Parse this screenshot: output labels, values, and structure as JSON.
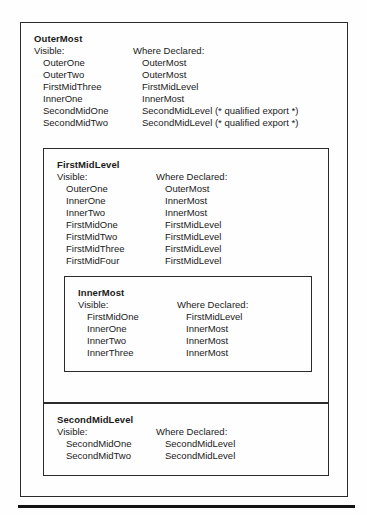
{
  "figure": {
    "kind": "nested-scope-visibility-diagram",
    "column_headers": {
      "visible": "Visible:",
      "where_declared": "Where Declared:"
    },
    "scopes": [
      {
        "id": "outermost",
        "title": "OuterMost",
        "visible": [
          "OuterOne",
          "OuterTwo",
          "FirstMidThree",
          "InnerOne",
          "SecondMidOne",
          "SecondMidTwo"
        ],
        "where_declared": [
          "OuterMost",
          "OuterMost",
          "FirstMidLevel",
          "InnerMost",
          "SecondMidLevel (* qualified export *)",
          "SecondMidLevel (* qualified export *)"
        ]
      },
      {
        "id": "firstmidlevel",
        "title": "FirstMidLevel",
        "visible": [
          "OuterOne",
          "InnerOne",
          "InnerTwo",
          "FirstMidOne",
          "FirstMidTwo",
          "FirstMidThree",
          "FirstMidFour"
        ],
        "where_declared": [
          "OuterMost",
          "InnerMost",
          "InnerMost",
          "FirstMidLevel",
          "FirstMidLevel",
          "FirstMidLevel",
          "FirstMidLevel"
        ]
      },
      {
        "id": "innermost",
        "title": "InnerMost",
        "visible": [
          "FirstMidOne",
          "InnerOne",
          "InnerTwo",
          "InnerThree"
        ],
        "where_declared": [
          "FirstMidLevel",
          "InnerMost",
          "InnerMost",
          "InnerMost"
        ]
      },
      {
        "id": "secondmidlevel",
        "title": "SecondMidLevel",
        "visible": [
          "SecondMidOne",
          "SecondMidTwo"
        ],
        "where_declared": [
          "SecondMidLevel",
          "SecondMidLevel"
        ]
      }
    ],
    "colors": {
      "ink": "#1a1a1a",
      "rule": "#141414",
      "border": "#2b2b2b",
      "paper": "#fefefe"
    }
  }
}
